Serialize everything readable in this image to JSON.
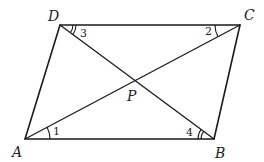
{
  "diagram": {
    "type": "parallelogram-with-diagonals",
    "vertices": {
      "A": {
        "label": "A"
      },
      "B": {
        "label": "B"
      },
      "C": {
        "label": "C"
      },
      "D": {
        "label": "D"
      },
      "P": {
        "label": "P"
      }
    },
    "angles": {
      "a1": {
        "label": "1",
        "vertex": "A",
        "arcs": 1
      },
      "a2": {
        "label": "2",
        "vertex": "C",
        "arcs": 1
      },
      "a3": {
        "label": "3",
        "vertex": "D",
        "arcs": 2
      },
      "a4": {
        "label": "4",
        "vertex": "B",
        "arcs": 2
      }
    },
    "edges": [
      "AB",
      "BC",
      "CD",
      "DA"
    ],
    "diagonals": [
      "AC",
      "BD"
    ],
    "colors": {
      "stroke": "#1a1a1a",
      "background": "#ffffff"
    }
  }
}
